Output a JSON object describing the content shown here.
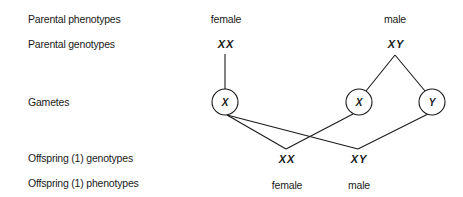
{
  "row_labels": {
    "parental_phenotypes": "Parental phenotypes",
    "parental_genotypes": "Parental genotypes",
    "gametes": "Gametes",
    "offspring_genotypes": "Offspring (1) genotypes",
    "offspring_phenotypes": "Offspring (1) phenotypes"
  },
  "parents": {
    "female": {
      "phenotype": "female",
      "genotype": "XX"
    },
    "male": {
      "phenotype": "male",
      "genotype": "XY"
    }
  },
  "gametes": {
    "female_x": "X",
    "male_x": "X",
    "male_y": "Y"
  },
  "offspring": [
    {
      "genotype": "XX",
      "phenotype": "female"
    },
    {
      "genotype": "XY",
      "phenotype": "male"
    }
  ]
}
